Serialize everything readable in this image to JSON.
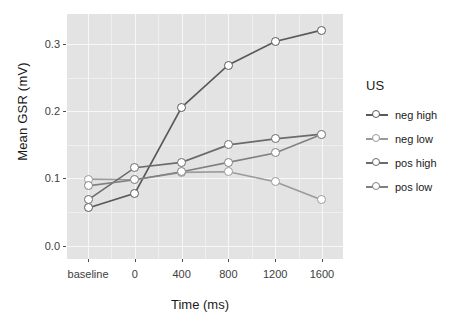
{
  "chart_data": {
    "type": "line",
    "title": "",
    "xlabel": "Time (ms)",
    "ylabel": "Mean GSR (mV)",
    "categories": [
      "baseline",
      "0",
      "400",
      "800",
      "1200",
      "1600"
    ],
    "x": [
      0,
      1,
      2,
      3,
      4,
      5
    ],
    "ylim": [
      -0.02,
      0.345
    ],
    "xlim": [
      -0.45,
      5.45
    ],
    "yticks": [
      0.0,
      0.1,
      0.2,
      0.3
    ],
    "ytick_labels": [
      "0.0",
      "0.1",
      "0.2",
      "0.3"
    ],
    "xtick_labels": [
      "baseline",
      "0",
      "400",
      "800",
      "1200",
      "1600"
    ],
    "grid": true,
    "legend_position": "right",
    "legend_title": "US",
    "series": [
      {
        "name": "neg high",
        "color": "#595959",
        "values": [
          0.056,
          0.078,
          0.206,
          0.269,
          0.304,
          0.321
        ]
      },
      {
        "name": "neg low",
        "color": "#9a9a9a",
        "values": [
          0.099,
          0.098,
          0.109,
          0.11,
          0.095,
          0.068
        ]
      },
      {
        "name": "pos high",
        "color": "#6b6b6b",
        "values": [
          0.068,
          0.116,
          0.124,
          0.15,
          0.159,
          0.166
        ]
      },
      {
        "name": "pos low",
        "color": "#808080",
        "values": [
          0.089,
          0.098,
          0.11,
          0.124,
          0.138,
          0.166
        ]
      }
    ]
  },
  "axes": {
    "y_title": "Mean GSR (mV)",
    "x_title": "Time (ms)"
  },
  "legend": {
    "title": "US",
    "items": [
      {
        "label": "neg high"
      },
      {
        "label": "neg low"
      },
      {
        "label": "pos high"
      },
      {
        "label": "pos low"
      }
    ]
  },
  "style": {
    "panel_background": "#e3e3e3",
    "major_grid": "#f7f7f7",
    "minor_grid": "#efefef",
    "text_color": "#1a1a1a",
    "tick_color": "#3d3d3d"
  }
}
